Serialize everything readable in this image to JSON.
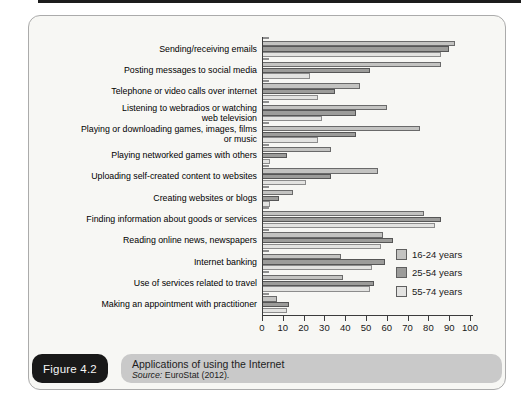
{
  "figure": {
    "label": "Figure 4.2",
    "title": "Applications of using the Internet",
    "source_prefix": "Source:",
    "source_rest": " EuroStat (2012)."
  },
  "colors": {
    "panel_bg": "#f7f7f4",
    "panel_border": "#ababab",
    "badge_bg": "#191919",
    "caption_bar_bg": "#c9c9c9",
    "axis": "#3c3c3c"
  },
  "chart_data": {
    "type": "bar",
    "orientation": "horizontal",
    "title": "Applications of using the Internet",
    "xlabel": "",
    "ylabel": "",
    "xlim": [
      0,
      100
    ],
    "xticks": [
      0,
      10,
      20,
      30,
      40,
      50,
      60,
      70,
      80,
      90,
      100
    ],
    "grid": false,
    "legend_position": "right-middle",
    "categories": [
      "Sending/receiving emails",
      "Posting messages to social media",
      "Telephone or video calls over internet",
      "Listening to webradios or watching\nweb television",
      "Playing or downloading games, images, films\nor music",
      "Playing networked games with others",
      "Uploading self-created content to websites",
      "Creating websites or blogs",
      "Finding information about goods or services",
      "Reading online news, newspapers",
      "Internet banking",
      "Use of services related to travel",
      "Making an appointment with practitioner"
    ],
    "series": [
      {
        "name": "16-24 years",
        "color": "#c3c3c1",
        "border_color": "#6a6a6a",
        "values": [
          93,
          86,
          47,
          60,
          76,
          33,
          56,
          15,
          78,
          58,
          38,
          39,
          7
        ]
      },
      {
        "name": "25-54 years",
        "color": "#9c9c9a",
        "border_color": "#565656",
        "values": [
          90,
          52,
          35,
          45,
          45,
          12,
          33,
          8,
          86,
          63,
          59,
          54,
          13
        ]
      },
      {
        "name": "55-74 years",
        "color": "#e3e3e1",
        "border_color": "#8c8c8c",
        "values": [
          86,
          23,
          27,
          29,
          27,
          4,
          21,
          4,
          83,
          57,
          53,
          52,
          12
        ]
      }
    ]
  }
}
